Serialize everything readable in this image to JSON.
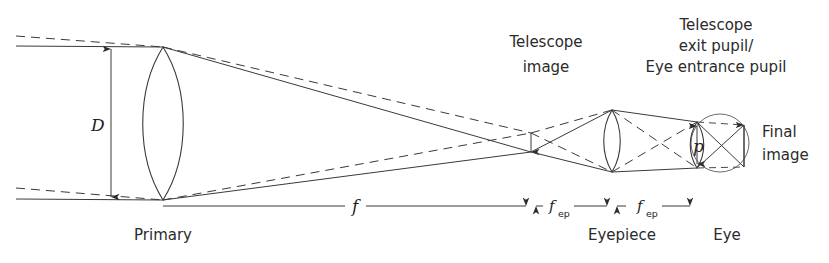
{
  "figure": {
    "domain": "diagram",
    "background_color": "#ffffff",
    "line_color": "#3a3a3a",
    "text_color": "#2b2b2b",
    "width": 829,
    "height": 263
  },
  "labels": {
    "aperture_diameter": "D",
    "primary": "Primary",
    "telescope_image_line1": "Telescope",
    "telescope_image_line2": "image",
    "exit_pupil_line1": "Telescope",
    "exit_pupil_line2": "exit pupil/",
    "exit_pupil_line3": "Eye entrance pupil",
    "pupil_diameter": "p",
    "final_image_line1": "Final",
    "final_image_line2": "image",
    "eyepiece": "Eyepiece",
    "eye": "Eye",
    "focal_length_primary": "f",
    "focal_length_eyepiece_1": "f",
    "focal_length_eyepiece_1_sub": "ep",
    "focal_length_eyepiece_2": "f",
    "focal_length_eyepiece_2_sub": "ep"
  },
  "optics": {
    "primary_lens": {
      "name": "Primary objective lens",
      "center_x": 163,
      "top_y": 47,
      "bottom_y": 200,
      "aperture_label": "D"
    },
    "eyepiece_lens": {
      "name": "Eyepiece lens",
      "center_x": 612,
      "top_y": 110,
      "bottom_y": 172,
      "label": "Eyepiece"
    },
    "eye": {
      "name": "Eye",
      "center_x": 720,
      "center_y": 143,
      "radius": 29,
      "label": "Eye"
    },
    "exit_pupil": {
      "name": "Exit pupil / eye lens",
      "center_x": 697,
      "top_y": 122,
      "bottom_y": 168,
      "label": "p"
    },
    "telescope_image": {
      "name": "Intermediate telescope image",
      "x": 531,
      "top_y": 133,
      "bottom_y": 152
    },
    "final_image": {
      "name": "Final retinal image",
      "x": 744,
      "top_y": 125,
      "bottom_y": 167
    },
    "optical_axis_y": 143
  },
  "dimensions": [
    {
      "name": "focal-length-primary",
      "label": "f",
      "subscript": "",
      "from_x": 163,
      "to_x": 531,
      "y": 206
    },
    {
      "name": "focal-length-eyepiece-image-side",
      "label": "f",
      "subscript": "ep",
      "from_x": 531,
      "to_x": 612,
      "y": 206
    },
    {
      "name": "focal-length-eyepiece-pupil-side",
      "label": "f",
      "subscript": "ep",
      "from_x": 612,
      "to_x": 697,
      "y": 206
    }
  ]
}
